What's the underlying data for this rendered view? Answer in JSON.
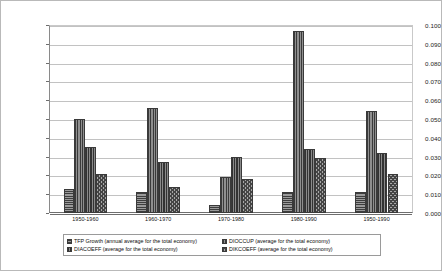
{
  "chart_data": {
    "type": "bar",
    "title": "",
    "subtitle": "",
    "xlabel": "",
    "ylabel": "",
    "ylim": [
      0.0,
      0.1
    ],
    "ytick_step": 0.01,
    "grid": true,
    "legend_position": "bottom",
    "categories": [
      "1950-1960",
      "1960-1970",
      "1970-1980",
      "1980-1990",
      "1950-1990"
    ],
    "ytick_labels": [
      "0.100",
      "0.090",
      "0.080",
      "0.070",
      "0.060",
      "0.050",
      "0.040",
      "0.030",
      "0.020",
      "0.010",
      "0.000"
    ],
    "ytick_values": [
      0.1,
      0.09,
      0.08,
      0.07,
      0.06,
      0.05,
      0.04,
      0.03,
      0.02,
      0.01,
      0.0
    ],
    "series": [
      {
        "name": "TFP Growth (annual average for the total economy)",
        "pattern": "horizontal-lines",
        "values": [
          0.013,
          0.011,
          0.004,
          0.011,
          0.011
        ]
      },
      {
        "name": "DIOCCUP (average for the total economy)",
        "pattern": "vertical-lines",
        "values": [
          0.05,
          0.056,
          0.019,
          0.097,
          0.054
        ]
      },
      {
        "name": "DIACOEFF (average for the total economy)",
        "pattern": "dense-vertical-lines",
        "values": [
          0.035,
          0.027,
          0.03,
          0.034,
          0.032
        ]
      },
      {
        "name": "DIKCOEFF (average for the total economy)",
        "pattern": "checkerboard",
        "values": [
          0.021,
          0.014,
          0.018,
          0.029,
          0.021
        ]
      }
    ]
  }
}
